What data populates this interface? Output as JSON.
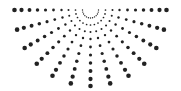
{
  "graphic": {
    "name": "radial-halftone-half-sunburst",
    "dot_color": "#222222",
    "background": "#ffffff",
    "center": [
      90.5,
      10
    ],
    "ray_count": 13,
    "angle_start_deg": 0,
    "angle_end_deg": 180,
    "radii": [
      8,
      15,
      22,
      29,
      37,
      45,
      53,
      61,
      69,
      76
    ],
    "dot_radius_min": 0.5,
    "dot_radius_max": 2.3
  }
}
